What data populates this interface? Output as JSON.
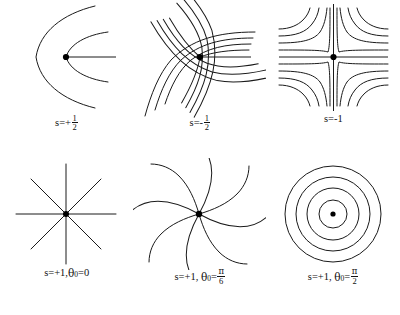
{
  "figure": {
    "background_color": "#ffffff",
    "stroke_color": "#1a1a1a",
    "dot_color": "#000000",
    "rows": 2,
    "columns": 3
  },
  "panels": [
    {
      "id": "panel-s-plus-half",
      "name": "s-plus-one-half",
      "pattern": "parabolic-half-charge",
      "charge": "+1/2",
      "label_parts": {
        "prefix": "s=+",
        "numerator": "1",
        "denominator": "2"
      },
      "label_text": "s=+1/2",
      "curve_count": 2,
      "has_center_dot": true,
      "has_straight_ray": true,
      "symmetry": "one-fold"
    },
    {
      "id": "panel-s-minus-half",
      "name": "s-minus-one-half",
      "pattern": "three-fold-hyperbolic",
      "charge": "-1/2",
      "label_parts": {
        "prefix": "s=-",
        "numerator": "1",
        "denominator": "2"
      },
      "label_text": "s=-1/2",
      "curve_count": 12,
      "has_center_dot": true,
      "has_straight_ray": true,
      "symmetry": "three-fold"
    },
    {
      "id": "panel-s-minus-one",
      "name": "s-minus-one",
      "pattern": "four-fold-hyperbolic",
      "charge": "-1",
      "label_parts": {
        "prefix": "s=-1",
        "numerator": "",
        "denominator": ""
      },
      "label_text": "s=-1",
      "curve_count": 16,
      "has_center_dot": true,
      "has_straight_ray": true,
      "symmetry": "four-fold"
    },
    {
      "id": "panel-s-plus-one-theta-0",
      "name": "s-plus-one-radial",
      "pattern": "radial-star",
      "charge": "+1",
      "theta0": "0",
      "label_parts": {
        "prefix": "s=+1,",
        "theta": "θ",
        "sub": "0",
        "equals": "=",
        "value": "0"
      },
      "label_text": "s=+1,θ0=0",
      "ray_count": 8,
      "has_center_dot": true,
      "symmetry": "eight-fold"
    },
    {
      "id": "panel-s-plus-one-theta-pi-6",
      "name": "s-plus-one-spiral",
      "pattern": "spiral",
      "charge": "+1",
      "theta0": "pi/6",
      "label_parts": {
        "prefix": "s=+1,",
        "theta": "θ",
        "sub": "0",
        "equals": "=",
        "numerator": "π",
        "denominator": "6"
      },
      "label_text": "s=+1, θ0=π/6",
      "ray_count": 8,
      "has_center_dot": true,
      "symmetry": "eight-fold"
    },
    {
      "id": "panel-s-plus-one-theta-pi-2",
      "name": "s-plus-one-circular",
      "pattern": "concentric-circles",
      "charge": "+1",
      "theta0": "pi/2",
      "label_parts": {
        "prefix": "s=+1,",
        "theta": "θ",
        "sub": "0",
        "equals": "=",
        "numerator": "π",
        "denominator": "2"
      },
      "label_text": "s=+1, θ0=π/2",
      "circle_count": 4,
      "has_center_dot": true,
      "symmetry": "rotational"
    }
  ]
}
